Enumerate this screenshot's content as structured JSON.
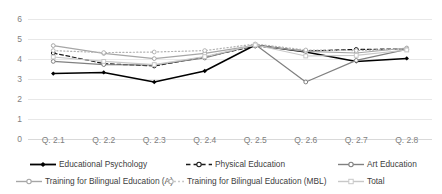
{
  "chart_data": {
    "type": "line",
    "title": "",
    "xlabel": "",
    "ylabel": "",
    "ylim": [
      0,
      6
    ],
    "y_ticks": [
      0,
      1,
      2,
      3,
      4,
      5,
      6
    ],
    "grid": true,
    "legend_position": "bottom",
    "categories": [
      "Q. 2.1",
      "Q. 2.2",
      "Q. 2.3",
      "Q. 2.4",
      "Q. 2.5",
      "Q. 2.6",
      "Q. 2.7",
      "Q. 2.8"
    ],
    "series": [
      {
        "name": "Educational Psychology",
        "color": "#000000",
        "line_style": "solid",
        "marker": "diamond",
        "values": [
          3.27,
          3.33,
          2.85,
          3.4,
          4.7,
          4.35,
          3.88,
          4.03
        ]
      },
      {
        "name": "Physical Education",
        "color": "#1a1a1a",
        "line_style": "dashed",
        "marker": "circle",
        "values": [
          4.3,
          3.77,
          3.65,
          4.1,
          4.65,
          4.4,
          4.48,
          4.5
        ]
      },
      {
        "name": "Art Education",
        "color": "#808080",
        "line_style": "solid",
        "marker": "circle",
        "values": [
          3.88,
          3.72,
          3.7,
          4.05,
          4.72,
          2.85,
          3.93,
          4.48
        ]
      },
      {
        "name": "Training for Bilingual Education (A)",
        "color": "#a6a6a6",
        "line_style": "solid",
        "marker": "circle",
        "values": [
          4.67,
          4.28,
          4.02,
          4.28,
          4.68,
          4.38,
          4.3,
          4.55
        ]
      },
      {
        "name": "Training for Bilingual Education (MBL)",
        "color": "#b3b3b3",
        "line_style": "dotted",
        "marker": "circle",
        "values": [
          4.42,
          4.32,
          4.35,
          4.42,
          4.75,
          4.45,
          4.42,
          4.5
        ]
      },
      {
        "name": "Total",
        "color": "#c8c8c8",
        "line_style": "solid",
        "marker": "square",
        "values": [
          4.1,
          3.88,
          3.72,
          4.12,
          4.7,
          4.15,
          4.18,
          4.45
        ]
      }
    ]
  },
  "legend": {
    "items": [
      {
        "label": "Educational Psychology"
      },
      {
        "label": "Physical Education"
      },
      {
        "label": "Art Education"
      },
      {
        "label": "Training for Bilingual Education (A)"
      },
      {
        "label": "Training for Bilingual Education (MBL)"
      },
      {
        "label": "Total"
      }
    ]
  }
}
